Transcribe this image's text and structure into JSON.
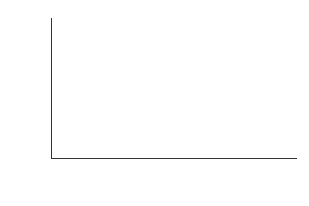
{
  "chart_data": {
    "type": "bar",
    "title": "",
    "xlabel": "年份",
    "ylabel": "人口出生率/‰",
    "categories": [
      "2000",
      "2005",
      "2008",
      "2009",
      "2010",
      "2011",
      "2012"
    ],
    "values": [
      10.64,
      10.79,
      11.77,
      11.8,
      12.4,
      12.67,
      15.21
    ],
    "value_labels": [
      "10.64",
      "10.79",
      "11.77",
      "11.80",
      "12.40",
      "12.67",
      "15.21"
    ],
    "yticks": [
      "0",
      "2",
      "4",
      "6",
      "8",
      "10",
      "12",
      "14",
      "16"
    ],
    "ylim": [
      0,
      16
    ],
    "grid": false,
    "legend": null,
    "bar_color": "#8c8c8c"
  }
}
